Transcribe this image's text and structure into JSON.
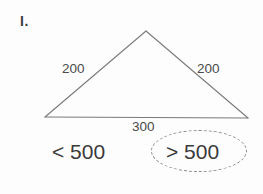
{
  "worksheet": {
    "problem_number": "I.",
    "figure": {
      "type": "triangle",
      "apex": {
        "x": 146,
        "y": 31
      },
      "left_vertex": {
        "x": 45,
        "y": 117
      },
      "right_vertex": {
        "x": 248,
        "y": 118
      },
      "stroke_color": "#7a7a7a",
      "stroke_width": 1,
      "side_labels": {
        "left": "200",
        "right": "200",
        "base": "300"
      }
    },
    "answers": {
      "option_less": "< 500",
      "option_greater": "> 500",
      "selected": "> 500",
      "selection_mark": "dashed-ellipse",
      "selection_color": "#8a8a8a"
    }
  }
}
